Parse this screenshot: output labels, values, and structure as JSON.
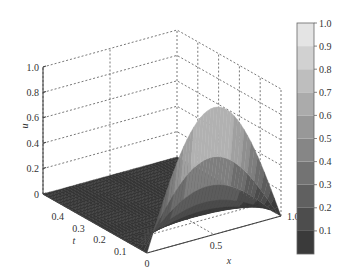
{
  "chart_data": {
    "type": "surface3d",
    "title": "",
    "xlabel": "x",
    "ylabel": "t",
    "zlabel": "u",
    "x_range": [
      0,
      1
    ],
    "t_range": [
      0,
      0.5
    ],
    "z_range": [
      0,
      1
    ],
    "x_ticks": [
      "0",
      "0.5",
      "1.0"
    ],
    "x_tick_values": [
      0,
      0.5,
      1
    ],
    "t_ticks": [
      "0.1",
      "0.2",
      "0.3",
      "0.4"
    ],
    "t_tick_values": [
      0.1,
      0.2,
      0.3,
      0.4
    ],
    "z_ticks": [
      "0",
      "0.2",
      "0.4",
      "0.6",
      "0.8",
      "1.0"
    ],
    "z_tick_values": [
      0,
      0.2,
      0.4,
      0.6,
      0.8,
      1.0
    ],
    "grid": true,
    "surface": {
      "description": "u(x,t) is zero over most of the domain; near t = 0 it rises to a peak of ~1.0 at x ≈ 0.5, forming a sin(pi x)-shaped hump that decays quickly as t increases",
      "peak_value": 1.0,
      "peak_location": {
        "x": 0.5,
        "t": 0
      }
    },
    "colorbar": {
      "position": "right",
      "ticks": [
        "0.1",
        "0.2",
        "0.3",
        "0.4",
        "0.5",
        "0.6",
        "0.7",
        "0.8",
        "0.9",
        "1.0"
      ],
      "tick_values": [
        0.1,
        0.2,
        0.3,
        0.4,
        0.5,
        0.6,
        0.7,
        0.8,
        0.9,
        1.0
      ],
      "range": [
        0,
        1.0
      ],
      "colormap": "gray",
      "low_color": "#3a3a3a",
      "high_color": "#e4e4e4"
    }
  }
}
